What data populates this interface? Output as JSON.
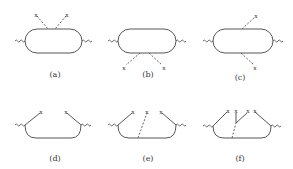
{
  "figure": {
    "panels": [
      {
        "id": "a",
        "label": "(a)",
        "description": "closed loop with two dashed insertions on top"
      },
      {
        "id": "b",
        "label": "(b)",
        "description": "closed loop with two dashed insertions on bottom"
      },
      {
        "id": "c",
        "label": "(c)",
        "description": "closed loop with one dashed insertion on top and one on bottom"
      },
      {
        "id": "d",
        "label": "(d)",
        "description": "open loop with two solid legs ending in crosses"
      },
      {
        "id": "e",
        "label": "(e)",
        "description": "open loop with two solid legs and one dashed insertion"
      },
      {
        "id": "f",
        "label": "(f)",
        "description": "open loop with solid legs, extra vertex and dashed line"
      }
    ],
    "cross_symbol": "x"
  }
}
